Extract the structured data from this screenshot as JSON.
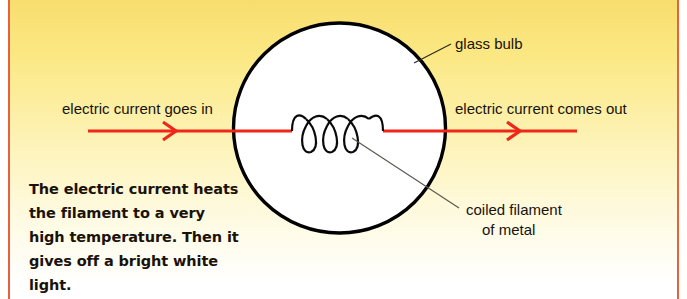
{
  "diagram": {
    "background": {
      "gradient_top": "#f8dd6e",
      "gradient_bottom": "#ffffff",
      "frame_rule_color": "#e8613c"
    },
    "bulb": {
      "name": "glass-bulb",
      "fill": "#ffffff",
      "stroke": "#000000",
      "center_x": 339,
      "center_y": 128,
      "radius_x": 106,
      "radius_y": 105
    },
    "wire": {
      "color": "#ef2718",
      "y": 131,
      "left_start_x": 88,
      "right_end_x": 577
    },
    "filament": {
      "name": "coiled-filament",
      "loops": 3,
      "stroke": "#0a0a0a"
    },
    "labels": {
      "current_in": "electric current goes in",
      "current_out": "electric current comes out",
      "glass_bulb": "glass bulb",
      "filament_line1": "coiled filament",
      "filament_line2": "of metal"
    },
    "paragraph": "The electric current heats the filament to a very high temperature. Then it gives off a bright white light."
  }
}
